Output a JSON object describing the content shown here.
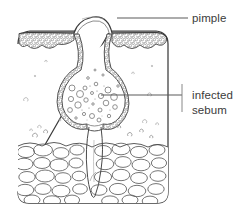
{
  "figure": {
    "type": "line-diagram",
    "background_color": "#ffffff",
    "ink_color": "#3b3b3b",
    "stipple_color": "#8a8a8a"
  },
  "labels": [
    {
      "id": "pimple",
      "text": "pimple",
      "text_x": 192,
      "text_y": 22,
      "leader": {
        "x1": 117,
        "y1": 18,
        "x2": 188,
        "y2": 18
      }
    },
    {
      "id": "infected-sebum",
      "text_line1": "infected",
      "text_line2": "sebum",
      "text_x": 192,
      "text_y": 99,
      "text_y2": 114,
      "leader": {
        "x1": 101,
        "y1": 95,
        "x2": 182,
        "y2": 95
      },
      "tick": {
        "x1": 182,
        "y1": 84,
        "x2": 182,
        "y2": 112
      }
    }
  ],
  "regions": [
    {
      "id": "skin-block",
      "name": "skin block outline",
      "x": 18,
      "y": 30,
      "width": 150,
      "height": 174
    },
    {
      "id": "epidermis",
      "name": "epidermis granular band"
    },
    {
      "id": "dermis",
      "name": "dermis open layer"
    },
    {
      "id": "fat-layer",
      "name": "subcutaneous fat cells"
    },
    {
      "id": "pimple-dome",
      "name": "raised pimple dome"
    },
    {
      "id": "follicle-sac",
      "name": "infected follicle sac"
    },
    {
      "id": "hair-shaft",
      "name": "hair shaft and root"
    }
  ]
}
